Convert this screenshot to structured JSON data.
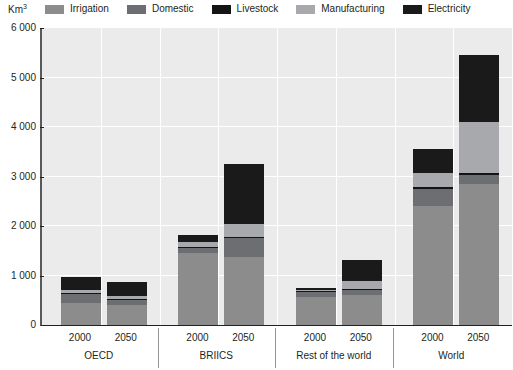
{
  "axis": {
    "y_unit": "Km",
    "y_unit_sup": "3",
    "y_ticks": [
      "6 000",
      "5 000",
      "4 000",
      "3 000",
      "2 000",
      "1 000",
      "0"
    ]
  },
  "legend": {
    "items": [
      {
        "label": "Irrigation",
        "color": "#8c8c8c",
        "icon": "legend-swatch-irrigation"
      },
      {
        "label": "Domestic",
        "color": "#6d6e71",
        "icon": "legend-swatch-domestic"
      },
      {
        "label": "Livestock",
        "color": "#141414",
        "icon": "legend-swatch-livestock"
      },
      {
        "label": "Manufacturing",
        "color": "#a7a9ac",
        "icon": "legend-swatch-manufacturing"
      },
      {
        "label": "Electricity",
        "color": "#1a1a1a",
        "icon": "legend-swatch-electricity"
      }
    ]
  },
  "groups": [
    {
      "name": "OECD",
      "years": [
        "2000",
        "2050"
      ]
    },
    {
      "name": "BRIICS",
      "years": [
        "2000",
        "2050"
      ]
    },
    {
      "name": "Rest of the world",
      "years": [
        "2000",
        "2050"
      ]
    },
    {
      "name": "World",
      "years": [
        "2000",
        "2050"
      ]
    }
  ],
  "chart_data": {
    "type": "bar",
    "subtype": "stacked",
    "title": "",
    "xlabel": "",
    "ylabel": "Km3",
    "ylim": [
      0,
      6000
    ],
    "ytick_step": 1000,
    "grid": true,
    "legend_position": "top",
    "categories": [
      "OECD 2000",
      "OECD 2050",
      "BRIICS 2000",
      "BRIICS 2050",
      "Rest of the world 2000",
      "Rest of the world 2050",
      "World 2000",
      "World 2050"
    ],
    "series": [
      {
        "name": "Irrigation",
        "color": "#8c8c8c",
        "values": [
          450,
          400,
          1450,
          1380,
          570,
          600,
          2400,
          2850
        ]
      },
      {
        "name": "Domestic",
        "color": "#6d6e71",
        "values": [
          170,
          110,
          100,
          370,
          90,
          100,
          350,
          190
        ]
      },
      {
        "name": "Livestock",
        "color": "#141414",
        "values": [
          25,
          25,
          30,
          30,
          25,
          25,
          40,
          40
        ]
      },
      {
        "name": "Manufacturing",
        "color": "#a7a9ac",
        "values": [
          60,
          55,
          90,
          270,
          20,
          170,
          280,
          1030
        ]
      },
      {
        "name": "Electricity",
        "color": "#1a1a1a",
        "values": [
          265,
          280,
          150,
          1200,
          45,
          420,
          490,
          1340
        ]
      }
    ],
    "totals": [
      970,
      870,
      1820,
      3250,
      750,
      1315,
      3560,
      5450
    ]
  }
}
